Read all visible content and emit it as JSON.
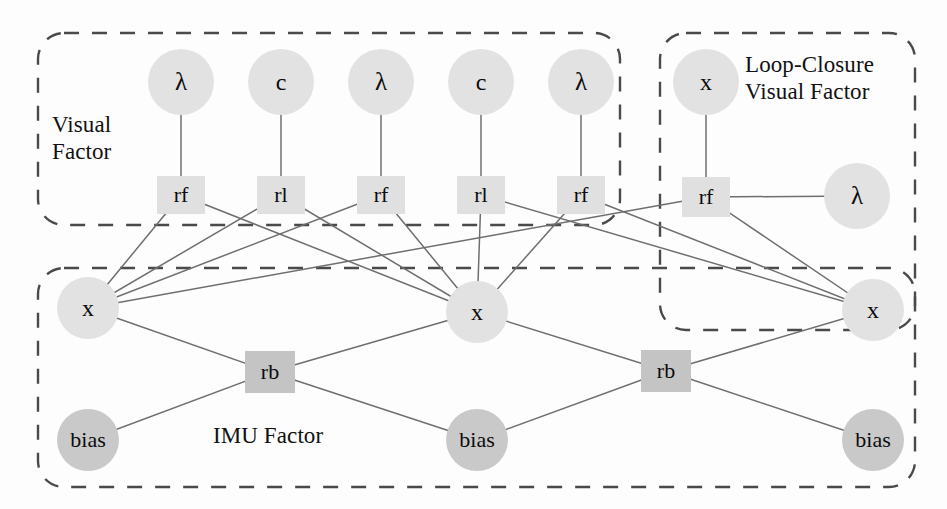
{
  "diagram": {
    "background": "#fdfdfd",
    "colors": {
      "node_light": "#e2e2e2",
      "node_dark": "#c9c9c9",
      "factor_light": "#e0e0e0",
      "factor_dark": "#c4c4c4",
      "edge": "#6f6f6f",
      "dashed_border": "#4a4a4a",
      "text": "#0c0c0c"
    },
    "groups": [
      {
        "id": "visual-factor",
        "label": "Visual\nFactor",
        "label_x": 52,
        "label_y": 112,
        "label_size": 23,
        "x": 38,
        "y": 33,
        "w": 582,
        "h": 192,
        "radius": 26
      },
      {
        "id": "loop-closure-visual-factor",
        "label": "Loop-Closure\nVisual Factor",
        "label_x": 745,
        "label_y": 52,
        "label_size": 23,
        "x": 660,
        "y": 33,
        "w": 255,
        "h": 297,
        "radius": 26
      },
      {
        "id": "imu-factor",
        "label": "IMU Factor",
        "label_x": 213,
        "label_y": 423,
        "label_size": 23,
        "x": 38,
        "y": 268,
        "w": 877,
        "h": 219,
        "radius": 26
      }
    ],
    "variable_nodes": [
      {
        "id": "lam1",
        "label": "λ",
        "x": 181,
        "y": 82,
        "r": 33,
        "shade": "light",
        "font": 25
      },
      {
        "id": "c1",
        "label": "c",
        "x": 281,
        "y": 82,
        "r": 33,
        "shade": "light",
        "font": 24
      },
      {
        "id": "lam2",
        "label": "λ",
        "x": 381,
        "y": 82,
        "r": 33,
        "shade": "light",
        "font": 25
      },
      {
        "id": "c2",
        "label": "c",
        "x": 481,
        "y": 82,
        "r": 33,
        "shade": "light",
        "font": 24
      },
      {
        "id": "lam3",
        "label": "λ",
        "x": 581,
        "y": 82,
        "r": 33,
        "shade": "light",
        "font": 25
      },
      {
        "id": "lcx",
        "label": "x",
        "x": 706,
        "y": 82,
        "r": 33,
        "shade": "light",
        "font": 24
      },
      {
        "id": "lclam",
        "label": "λ",
        "x": 857,
        "y": 196,
        "r": 33,
        "shade": "light",
        "font": 25
      },
      {
        "id": "x1",
        "label": "x",
        "x": 88,
        "y": 308,
        "r": 31,
        "shade": "light",
        "font": 24
      },
      {
        "id": "x2",
        "label": "x",
        "x": 477,
        "y": 312,
        "r": 31,
        "shade": "light",
        "font": 24
      },
      {
        "id": "x3",
        "label": "x",
        "x": 873,
        "y": 310,
        "r": 31,
        "shade": "light",
        "font": 24
      },
      {
        "id": "bias1",
        "label": "bias",
        "x": 88,
        "y": 440,
        "r": 31,
        "shade": "dark",
        "font": 22
      },
      {
        "id": "bias2",
        "label": "bias",
        "x": 477,
        "y": 440,
        "r": 31,
        "shade": "dark",
        "font": 22
      },
      {
        "id": "bias3",
        "label": "bias",
        "x": 873,
        "y": 440,
        "r": 31,
        "shade": "dark",
        "font": 22
      }
    ],
    "factor_nodes": [
      {
        "id": "rf1",
        "label": "rf",
        "x": 181,
        "y": 195,
        "w": 48,
        "h": 38,
        "shade": "light",
        "font": 22
      },
      {
        "id": "rl1",
        "label": "rl",
        "x": 281,
        "y": 195,
        "w": 48,
        "h": 38,
        "shade": "light",
        "font": 22
      },
      {
        "id": "rf2",
        "label": "rf",
        "x": 381,
        "y": 195,
        "w": 48,
        "h": 38,
        "shade": "light",
        "font": 22
      },
      {
        "id": "rl2",
        "label": "rl",
        "x": 481,
        "y": 195,
        "w": 48,
        "h": 38,
        "shade": "light",
        "font": 22
      },
      {
        "id": "rf3",
        "label": "rf",
        "x": 581,
        "y": 195,
        "w": 48,
        "h": 38,
        "shade": "light",
        "font": 22
      },
      {
        "id": "lcrf",
        "label": "rf",
        "x": 706,
        "y": 197,
        "w": 48,
        "h": 40,
        "shade": "light",
        "font": 22
      },
      {
        "id": "rb1",
        "label": "rb",
        "x": 270,
        "y": 372,
        "w": 50,
        "h": 42,
        "shade": "dark",
        "font": 22
      },
      {
        "id": "rb2",
        "label": "rb",
        "x": 666,
        "y": 371,
        "w": 50,
        "h": 42,
        "shade": "dark",
        "font": 22
      }
    ],
    "edges": [
      {
        "from": "lam1",
        "to": "rf1",
        "kind": "vertical"
      },
      {
        "from": "c1",
        "to": "rl1",
        "kind": "vertical"
      },
      {
        "from": "lam2",
        "to": "rf2",
        "kind": "vertical"
      },
      {
        "from": "c2",
        "to": "rl2",
        "kind": "vertical"
      },
      {
        "from": "lam3",
        "to": "rf3",
        "kind": "vertical"
      },
      {
        "from": "lcx",
        "to": "lcrf",
        "kind": "vertical"
      },
      {
        "from": "lcrf",
        "to": "lclam",
        "kind": "horizontal"
      },
      {
        "from": "rf1",
        "to": "x1",
        "kind": "diagonal"
      },
      {
        "from": "rf1",
        "to": "x2",
        "kind": "diagonal"
      },
      {
        "from": "rl1",
        "to": "x1",
        "kind": "diagonal"
      },
      {
        "from": "rl1",
        "to": "x2",
        "kind": "diagonal"
      },
      {
        "from": "rf2",
        "to": "x1",
        "kind": "diagonal"
      },
      {
        "from": "rf2",
        "to": "x2",
        "kind": "diagonal"
      },
      {
        "from": "rl2",
        "to": "x2",
        "kind": "diagonal"
      },
      {
        "from": "rl2",
        "to": "x3",
        "kind": "diagonal"
      },
      {
        "from": "rf3",
        "to": "x2",
        "kind": "diagonal"
      },
      {
        "from": "rf3",
        "to": "x3",
        "kind": "diagonal"
      },
      {
        "from": "lcrf",
        "to": "x1",
        "kind": "diagonal"
      },
      {
        "from": "lcrf",
        "to": "x3",
        "kind": "diagonal"
      },
      {
        "from": "x1",
        "to": "rb1",
        "kind": "diagonal"
      },
      {
        "from": "bias1",
        "to": "rb1",
        "kind": "diagonal"
      },
      {
        "from": "rb1",
        "to": "x2",
        "kind": "diagonal"
      },
      {
        "from": "rb1",
        "to": "bias2",
        "kind": "diagonal"
      },
      {
        "from": "x2",
        "to": "rb2",
        "kind": "diagonal"
      },
      {
        "from": "bias2",
        "to": "rb2",
        "kind": "diagonal"
      },
      {
        "from": "rb2",
        "to": "x3",
        "kind": "diagonal"
      },
      {
        "from": "rb2",
        "to": "bias3",
        "kind": "diagonal"
      }
    ]
  }
}
